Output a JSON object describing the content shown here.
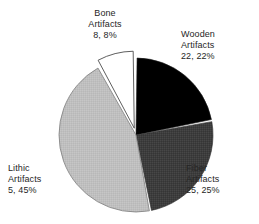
{
  "chart_data": {
    "type": "pie",
    "title": "",
    "subtitle": "",
    "xlabel": "",
    "ylabel": "",
    "legend_position": "none",
    "grid": false,
    "labels_inline": true,
    "categories": [
      "Wooden Artifacts",
      "Fiber Artifacts",
      "Lithic Artifacts",
      "Bone Artifacts"
    ],
    "values": [
      22,
      25,
      45,
      8
    ],
    "slices": [
      {
        "name": "Wooden Artifacts",
        "name_line1": "Wooden",
        "name_line2": "Artifacts",
        "value_text": "22, 22%",
        "count": 22,
        "percent": 22,
        "color": "#000000",
        "start_angle": 0,
        "end_angle": 79.2,
        "exploded": false
      },
      {
        "name": "Fiber Artifacts",
        "name_line1": "Fiber",
        "name_line2": "Artifacts",
        "value_text": "25, 25%",
        "count": 25,
        "percent": 25,
        "color": "#3d3d3d",
        "start_angle": 79.2,
        "end_angle": 169.2,
        "exploded": false
      },
      {
        "name": "Lithic Artifacts",
        "name_line1": "Lithic",
        "name_line2": "Artifacts",
        "value_text": "5, 45%",
        "count": 5,
        "percent": 45,
        "color": "#bfbfbf",
        "start_angle": 169.2,
        "end_angle": 331.2,
        "exploded": false
      },
      {
        "name": "Bone Artifacts",
        "name_line1": "Bone",
        "name_line2": "Artifacts",
        "value_text": "8, 8%",
        "count": 8,
        "percent": 8,
        "color": "#ffffff",
        "start_angle": 331.2,
        "end_angle": 360,
        "exploded": true
      }
    ],
    "colors": {
      "wooden": "#000000",
      "fiber": "#3d3d3d",
      "lithic": "#bfbfbf",
      "bone": "#ffffff",
      "outline": "#4d4d4d",
      "background": "#ffffff",
      "label_text": "#262626"
    }
  }
}
